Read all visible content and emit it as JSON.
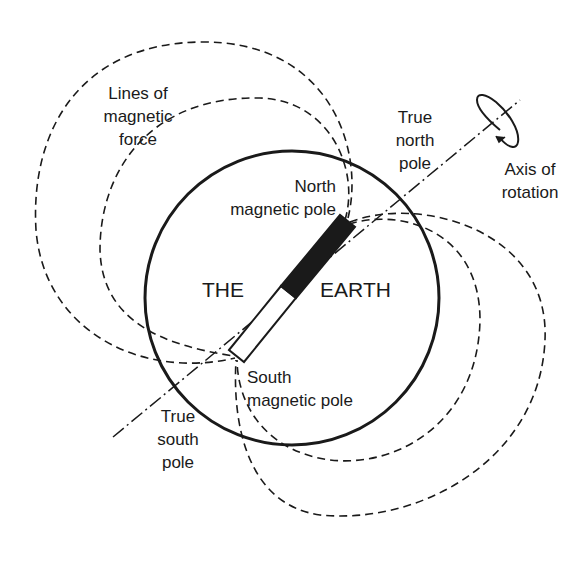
{
  "diagram": {
    "labels": {
      "lines_of_force": [
        "Lines of",
        "magnetic",
        "force"
      ],
      "true_north": [
        "True",
        "north",
        "pole"
      ],
      "axis_rotation": [
        "Axis of",
        "rotation"
      ],
      "north_magnetic": [
        "North",
        "magnetic pole"
      ],
      "the": "THE",
      "earth": "EARTH",
      "south_magnetic": [
        "South",
        "magnetic pole"
      ],
      "true_south": [
        "True",
        "south",
        "pole"
      ]
    },
    "colors": {
      "ink": "#1a1a1a",
      "background": "#ffffff"
    }
  }
}
